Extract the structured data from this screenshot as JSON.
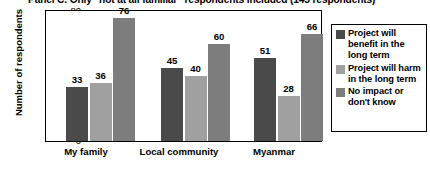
{
  "chart_data": {
    "type": "bar",
    "title": "Panel C. Only \"not at all familiar\" respondents included (145 respondents)",
    "xlabel": "",
    "ylabel": "Number of respondents",
    "ylim": [
      0,
      80
    ],
    "yticks": [
      0,
      20,
      40,
      60,
      80
    ],
    "grid": false,
    "legend_position": "right",
    "categories": [
      "My family",
      "Local community",
      "Myanmar"
    ],
    "series": [
      {
        "name": "Project will benefit in the long term",
        "color": "#4a4a4a",
        "values": [
          33,
          45,
          51
        ]
      },
      {
        "name": "Project will harm in the long term",
        "color": "#a0a0a0",
        "values": [
          36,
          40,
          28
        ]
      },
      {
        "name": "No impact or don't know",
        "color": "#7d7d7d",
        "values": [
          76,
          60,
          66
        ]
      }
    ]
  },
  "axis": {
    "ytick_labels": [
      "80",
      "60",
      "40",
      "20",
      "0"
    ]
  }
}
